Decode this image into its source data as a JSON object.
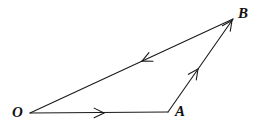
{
  "figure": {
    "kind": "vector-triangle-diagram",
    "background_color": "#ffffff",
    "stroke_color": "#1a1a1a",
    "stroke_width": 1.1,
    "width": 258,
    "height": 129,
    "vertices": [
      {
        "name": "O",
        "label": "O",
        "x": 30,
        "y": 113,
        "label_x": 12,
        "label_y": 105
      },
      {
        "name": "A",
        "label": "A",
        "x": 168,
        "y": 112,
        "label_x": 175,
        "label_y": 104
      },
      {
        "name": "B",
        "label": "B",
        "x": 233,
        "y": 19,
        "label_x": 238,
        "label_y": 6
      }
    ],
    "edges": [
      {
        "name": "edge-OA",
        "from": "O",
        "to": "A",
        "x1": 30,
        "y1": 113,
        "x2": 168,
        "y2": 112,
        "direction_label": "O to A",
        "arrow": {
          "x": 104,
          "y": 112.95,
          "angle_deg": 0,
          "size": 11,
          "spread_deg": 26
        }
      },
      {
        "name": "edge-AB",
        "from": "A",
        "to": "B",
        "x1": 168,
        "y1": 112,
        "x2": 233,
        "y2": 19,
        "direction_label": "A to B",
        "arrow": {
          "x": 198,
          "y": 69,
          "angle_deg": -55.05,
          "size": 11,
          "spread_deg": 26
        },
        "arrow2": {
          "x": 232,
          "y": 20.4,
          "angle_deg": -55.05,
          "size": 11,
          "spread_deg": 26
        }
      },
      {
        "name": "edge-BO",
        "from": "B",
        "to": "O",
        "x1": 233,
        "y1": 19,
        "x2": 30,
        "y2": 113,
        "direction_label": "B to O",
        "arrow": {
          "x": 142,
          "y": 61.1,
          "angle_deg": 155.17,
          "size": 11,
          "spread_deg": 26
        }
      }
    ],
    "labels": {
      "O": "O",
      "A": "A",
      "B": "B"
    }
  }
}
